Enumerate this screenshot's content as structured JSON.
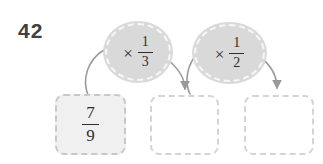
{
  "colors": {
    "page-bg": "#ffffff",
    "problem-number-color": "#404040",
    "bubble-fill": "#d9d9d9",
    "bubble-dash": "#f7f7f7",
    "box-start-fill": "#f0f0f0",
    "box-start-dash": "#c8c8c8",
    "box-answer-fill": "#ffffff",
    "box-answer-dash": "#d4d4d4",
    "arrow-color": "#999999",
    "math-ink": "#2e2e2e"
  },
  "problem": {
    "number": "42",
    "start_value": {
      "numerator": "7",
      "denominator": "9"
    },
    "operations": [
      {
        "symbol": "×",
        "fraction": {
          "numerator": "1",
          "denominator": "3"
        }
      },
      {
        "symbol": "×",
        "fraction": {
          "numerator": "1",
          "denominator": "2"
        }
      }
    ],
    "answer_boxes": [
      {
        "value": ""
      },
      {
        "value": ""
      }
    ]
  }
}
